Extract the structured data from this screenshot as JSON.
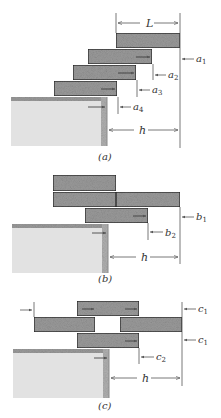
{
  "figure": {
    "colors": {
      "block_fill": "#9a9a9a",
      "block_border": "#222222",
      "table_fill": "#e2e2e2",
      "table_edge": "#8a8a8a",
      "dimension_line": "#555555",
      "text": "#333333"
    },
    "panels": [
      {
        "id": "a",
        "caption": "(a)",
        "dimension_labels": {
          "length": "L",
          "overhang": "h"
        },
        "offset_labels": [
          "a1",
          "a2",
          "a3",
          "a4"
        ],
        "offset_labels_display": [
          {
            "base": "a",
            "sub": "1"
          },
          {
            "base": "a",
            "sub": "2"
          },
          {
            "base": "a",
            "sub": "3"
          },
          {
            "base": "a",
            "sub": "4"
          }
        ],
        "block_count": 4
      },
      {
        "id": "b",
        "caption": "(b)",
        "dimension_labels": {
          "overhang": "h"
        },
        "offset_labels_display": [
          {
            "base": "b",
            "sub": "1"
          },
          {
            "base": "b",
            "sub": "2"
          }
        ],
        "block_count": 4
      },
      {
        "id": "c",
        "caption": "(c)",
        "dimension_labels": {
          "overhang": "h"
        },
        "offset_labels_display": [
          {
            "base": "c",
            "sub": "1"
          },
          {
            "base": "c",
            "sub": "1"
          },
          {
            "base": "c",
            "sub": "2"
          }
        ],
        "block_count": 4
      }
    ]
  }
}
